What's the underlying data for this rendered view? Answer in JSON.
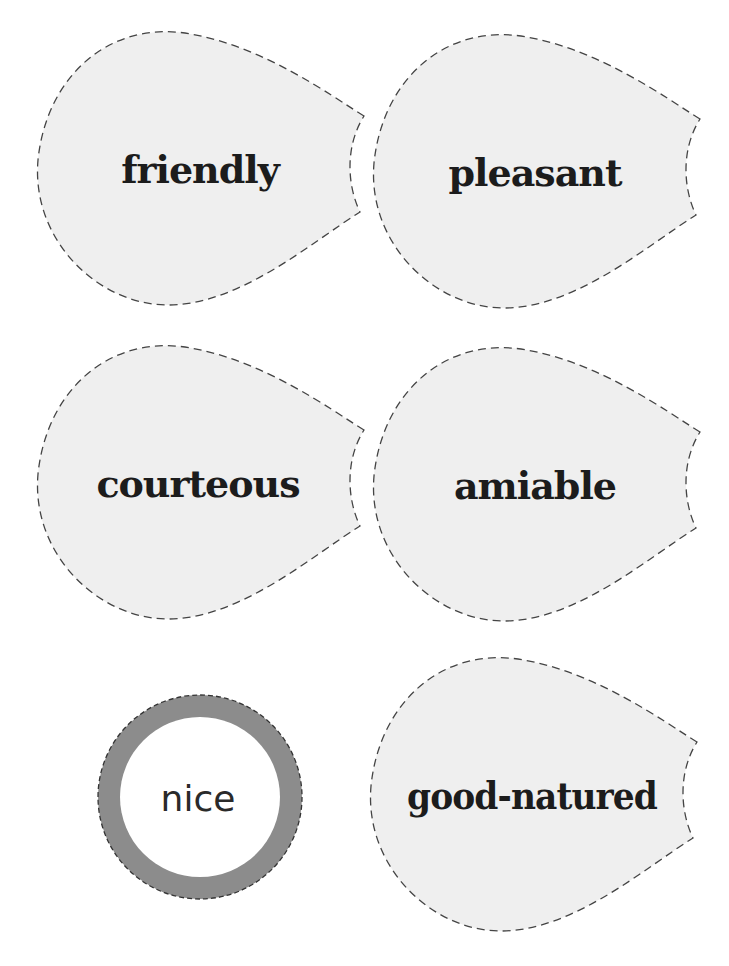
{
  "center": {
    "label": "nice",
    "ring_color": "#8c8c8c"
  },
  "petals": [
    {
      "label": "friendly"
    },
    {
      "label": "pleasant"
    },
    {
      "label": "courteous"
    },
    {
      "label": "amiable"
    },
    {
      "label": "good-natured"
    }
  ],
  "colors": {
    "petal_fill": "#efefef",
    "dash_stroke": "#444444",
    "text": "#1c1c1c"
  }
}
